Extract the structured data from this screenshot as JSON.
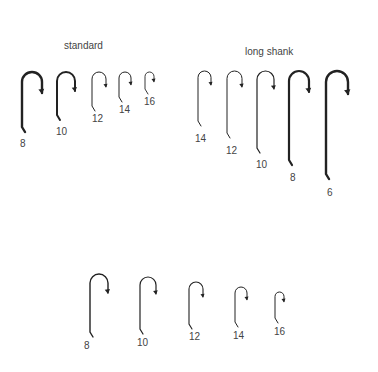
{
  "groups": [
    {
      "title": "standard",
      "title_pos": [
        64,
        40
      ],
      "hooks": [
        {
          "size": "8",
          "x": 22,
          "top": 72,
          "bottom": 127,
          "w": 20,
          "stroke": 2.4,
          "lbl": [
            20,
            138
          ]
        },
        {
          "size": "10",
          "x": 57,
          "top": 72,
          "bottom": 115,
          "w": 18,
          "stroke": 2.0,
          "lbl": [
            56,
            126
          ]
        },
        {
          "size": "12",
          "x": 92,
          "top": 72,
          "bottom": 106,
          "w": 14,
          "stroke": 1.0,
          "lbl": [
            92,
            113
          ]
        },
        {
          "size": "14",
          "x": 119,
          "top": 72,
          "bottom": 97,
          "w": 12,
          "stroke": 1.0,
          "lbl": [
            119,
            104
          ]
        },
        {
          "size": "16",
          "x": 145,
          "top": 72,
          "bottom": 89,
          "w": 9,
          "stroke": 0.9,
          "lbl": [
            144,
            96
          ]
        }
      ]
    },
    {
      "title": "long shank",
      "title_pos": [
        245,
        46
      ],
      "hooks": [
        {
          "size": "14",
          "x": 198,
          "top": 71,
          "bottom": 121,
          "w": 13,
          "stroke": 1.0,
          "lbl": [
            195,
            133
          ]
        },
        {
          "size": "12",
          "x": 227,
          "top": 71,
          "bottom": 133,
          "w": 15,
          "stroke": 1.0,
          "lbl": [
            226,
            145
          ]
        },
        {
          "size": "10",
          "x": 257,
          "top": 71,
          "bottom": 148,
          "w": 17,
          "stroke": 1.2,
          "lbl": [
            256,
            159
          ]
        },
        {
          "size": "8",
          "x": 289,
          "top": 71,
          "bottom": 160,
          "w": 20,
          "stroke": 2.2,
          "lbl": [
            290,
            172
          ]
        },
        {
          "size": "6",
          "x": 326,
          "top": 71,
          "bottom": 174,
          "w": 22,
          "stroke": 2.4,
          "lbl": [
            327,
            187
          ]
        }
      ]
    },
    {
      "title": "",
      "hooks": [
        {
          "size": "8",
          "x": 90,
          "top": 274,
          "bottom": 332,
          "w": 18,
          "stroke": 1.4,
          "lbl": [
            84,
            340
          ]
        },
        {
          "size": "10",
          "x": 140,
          "top": 277,
          "bottom": 329,
          "w": 16,
          "stroke": 1.2,
          "lbl": [
            137,
            337
          ]
        },
        {
          "size": "12",
          "x": 189,
          "top": 282,
          "bottom": 324,
          "w": 14,
          "stroke": 1.1,
          "lbl": [
            189,
            331
          ]
        },
        {
          "size": "14",
          "x": 235,
          "top": 287,
          "bottom": 322,
          "w": 12,
          "stroke": 1.0,
          "lbl": [
            233,
            330
          ]
        },
        {
          "size": "16",
          "x": 275,
          "top": 292,
          "bottom": 318,
          "w": 9,
          "stroke": 1.0,
          "lbl": [
            274,
            326
          ]
        }
      ]
    }
  ]
}
